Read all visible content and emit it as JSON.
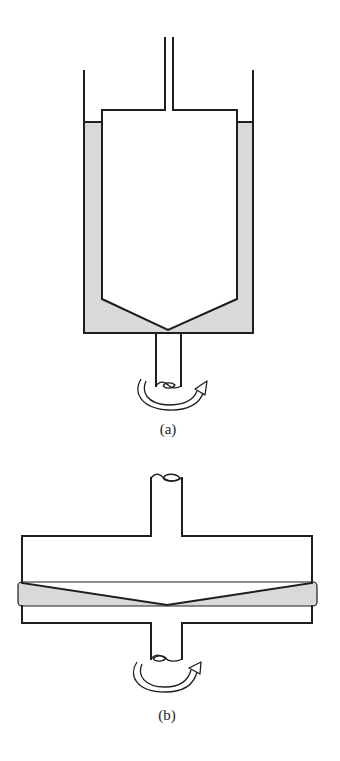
{
  "figure": {
    "panels": [
      {
        "id": "a",
        "caption": "(a)",
        "description": "Cone-in-cup (concentric cylinder with conical bottom) viscometer: inner cone-tipped bob on a stationary rod inside a rotating cup filled with fluid",
        "parts": [
          "outer-cup",
          "fluid",
          "inner-bob",
          "top-rod",
          "drive-shaft",
          "rotation-arrow"
        ]
      },
      {
        "id": "b",
        "caption": "(b)",
        "description": "Cone-and-plate viscometer: upper conical plate on a shaft above a rotating lower plate with fluid film in the gap",
        "parts": [
          "upper-cone-plate",
          "upper-shaft",
          "fluid-gap",
          "lower-plate",
          "drive-shaft",
          "rotation-arrow"
        ]
      }
    ],
    "colors": {
      "line": "#1e1e1e",
      "fluid": "#d9d9d9",
      "background": "#ffffff"
    }
  }
}
